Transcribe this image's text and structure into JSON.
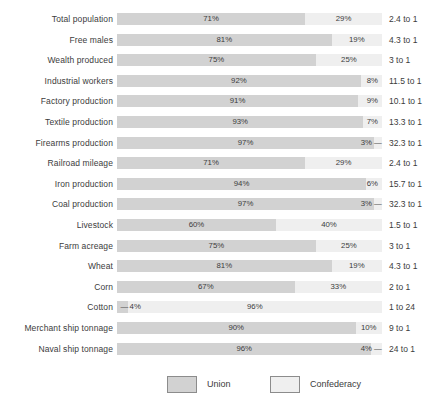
{
  "chart_data": {
    "type": "bar",
    "subtype": "stacked-horizontal-100pct",
    "title": "",
    "xlabel": "",
    "ylabel": "",
    "xlim": [
      0,
      100
    ],
    "grid": false,
    "legend_position": "bottom-center",
    "categories": [
      "Total population",
      "Free males",
      "Wealth produced",
      "Industrial workers",
      "Factory production",
      "Textile production",
      "Firearms production",
      "Railroad mileage",
      "Iron production",
      "Coal production",
      "Livestock",
      "Farm acreage",
      "Wheat",
      "Corn",
      "Cotton",
      "Merchant ship tonnage",
      "Naval ship tonnage"
    ],
    "series": [
      {
        "name": "Union",
        "color": "#d2d2d2",
        "values": [
          71,
          81,
          75,
          92,
          91,
          93,
          97,
          71,
          94,
          97,
          60,
          75,
          81,
          67,
          4,
          90,
          96
        ]
      },
      {
        "name": "Confederacy",
        "color": "#efefef",
        "values": [
          29,
          19,
          25,
          8,
          9,
          7,
          3,
          29,
          6,
          3,
          40,
          25,
          19,
          33,
          96,
          10,
          4
        ]
      }
    ],
    "annotations": {
      "ratio_column_header": "",
      "ratios": [
        "2.4 to 1",
        "4.3 to 1",
        "3 to 1",
        "11.5 to 1",
        "10.1 to 1",
        "13.3 to 1",
        "32.3 to 1",
        "2.4 to 1",
        "15.7 to 1",
        "32.3 to 1",
        "1.5 to 1",
        "3 to 1",
        "4.3 to 1",
        "2 to 1",
        "1 to 24",
        "9 to 1",
        "24 to 1"
      ]
    }
  },
  "rows": [
    {
      "label": "Total population",
      "union": 71,
      "conf": 29,
      "union_pct_text": "71%",
      "conf_pct_text": "29%",
      "ratio": "2.4 to 1",
      "leader": "none"
    },
    {
      "label": "Free males",
      "union": 81,
      "conf": 19,
      "union_pct_text": "81%",
      "conf_pct_text": "19%",
      "ratio": "4.3 to 1",
      "leader": "none"
    },
    {
      "label": "Wealth produced",
      "union": 75,
      "conf": 25,
      "union_pct_text": "75%",
      "conf_pct_text": "25%",
      "ratio": "3 to 1",
      "leader": "none"
    },
    {
      "label": "Industrial workers",
      "union": 92,
      "conf": 8,
      "union_pct_text": "92%",
      "conf_pct_text": "8%",
      "ratio": "11.5 to 1",
      "leader": "none"
    },
    {
      "label": "Factory production",
      "union": 91,
      "conf": 9,
      "union_pct_text": "91%",
      "conf_pct_text": "9%",
      "ratio": "10.1 to 1",
      "leader": "none"
    },
    {
      "label": "Textile production",
      "union": 93,
      "conf": 7,
      "union_pct_text": "93%",
      "conf_pct_text": "7%",
      "ratio": "13.3 to 1",
      "leader": "none"
    },
    {
      "label": "Firearms production",
      "union": 97,
      "conf": 3,
      "union_pct_text": "97%",
      "conf_pct_text": "3%",
      "ratio": "32.3 to 1",
      "leader": "right"
    },
    {
      "label": "Railroad mileage",
      "union": 71,
      "conf": 29,
      "union_pct_text": "71%",
      "conf_pct_text": "29%",
      "ratio": "2.4 to 1",
      "leader": "none"
    },
    {
      "label": "Iron production",
      "union": 94,
      "conf": 6,
      "union_pct_text": "94%",
      "conf_pct_text": "6%",
      "ratio": "15.7 to 1",
      "leader": "none"
    },
    {
      "label": "Coal production",
      "union": 97,
      "conf": 3,
      "union_pct_text": "97%",
      "conf_pct_text": "3%",
      "ratio": "32.3 to 1",
      "leader": "right"
    },
    {
      "label": "Livestock",
      "union": 60,
      "conf": 40,
      "union_pct_text": "60%",
      "conf_pct_text": "40%",
      "ratio": "1.5 to 1",
      "leader": "none"
    },
    {
      "label": "Farm acreage",
      "union": 75,
      "conf": 25,
      "union_pct_text": "75%",
      "conf_pct_text": "25%",
      "ratio": "3 to 1",
      "leader": "none"
    },
    {
      "label": "Wheat",
      "union": 81,
      "conf": 19,
      "union_pct_text": "81%",
      "conf_pct_text": "19%",
      "ratio": "4.3 to 1",
      "leader": "none"
    },
    {
      "label": "Corn",
      "union": 67,
      "conf": 33,
      "union_pct_text": "67%",
      "conf_pct_text": "33%",
      "ratio": "2 to 1",
      "leader": "none"
    },
    {
      "label": "Cotton",
      "union": 4,
      "conf": 96,
      "union_pct_text": "4%",
      "conf_pct_text": "96%",
      "ratio": "1 to 24",
      "leader": "left"
    },
    {
      "label": "Merchant ship tonnage",
      "union": 90,
      "conf": 10,
      "union_pct_text": "90%",
      "conf_pct_text": "10%",
      "ratio": "9 to 1",
      "leader": "none"
    },
    {
      "label": "Naval ship tonnage",
      "union": 96,
      "conf": 4,
      "union_pct_text": "96%",
      "conf_pct_text": "4%",
      "ratio": "24 to 1",
      "leader": "right"
    }
  ],
  "legend": {
    "union_label": "Union",
    "confederacy_label": "Confederacy",
    "union_color": "#d2d2d2",
    "confederacy_color": "#efefef"
  },
  "leader_glyph": "—"
}
